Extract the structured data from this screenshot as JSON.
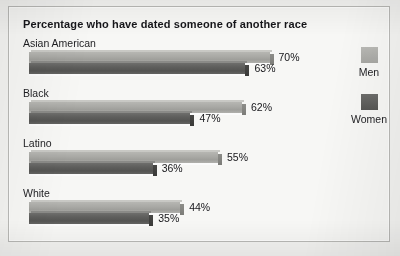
{
  "chart_data": {
    "type": "bar",
    "orientation": "horizontal",
    "title": "Percentage who have dated someone of another race",
    "xlabel": "",
    "ylabel": "",
    "xlim": [
      0,
      78
    ],
    "grid": false,
    "legend_position": "right",
    "value_suffix": "%",
    "categories": [
      "Asian American",
      "Black",
      "Latino",
      "White"
    ],
    "series": [
      {
        "name": "Men",
        "color": "#a9a9a5",
        "values": [
          70,
          62,
          55,
          44
        ]
      },
      {
        "name": "Women",
        "color": "#5d5d5b",
        "values": [
          63,
          47,
          36,
          35
        ]
      }
    ],
    "labels": {
      "men": [
        "70%",
        "62%",
        "55%",
        "44%"
      ],
      "women": [
        "63%",
        "47%",
        "36%",
        "35%"
      ]
    }
  },
  "legend": {
    "items": [
      {
        "label": "Men",
        "color": "#a9a9a5"
      },
      {
        "label": "Women",
        "color": "#5d5d5b"
      }
    ]
  }
}
